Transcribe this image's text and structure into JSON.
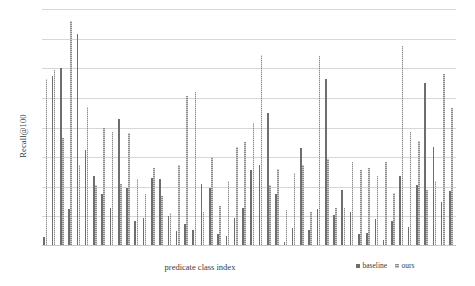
{
  "chart_data": {
    "type": "bar",
    "title": "",
    "subtitle": "",
    "xlabel": "predicate class index",
    "ylabel": "Recall@100",
    "grid": true,
    "gridlines": 8,
    "legend_position": "bottom-right",
    "ylim": [
      0,
      80
    ],
    "yticks_visible": false,
    "categories": [
      "1",
      "2",
      "3",
      "4",
      "5",
      "6",
      "7",
      "8",
      "9",
      "10",
      "11",
      "12",
      "13",
      "14",
      "15",
      "16",
      "17",
      "18",
      "19",
      "20",
      "21",
      "22",
      "23",
      "24",
      "25",
      "26",
      "27",
      "28",
      "29",
      "30",
      "31",
      "32",
      "33",
      "34",
      "35",
      "36",
      "37",
      "38",
      "39",
      "40",
      "41",
      "42",
      "43",
      "44",
      "45",
      "46",
      "47",
      "48",
      "49",
      "50"
    ],
    "series": [
      {
        "name": "baseline",
        "color": "#6e6e6e",
        "values": [
          3.0,
          57.5,
          60.0,
          12.5,
          71.5,
          32.5,
          23.5,
          17.5,
          13.0,
          43.0,
          19.5,
          8.5,
          9.5,
          23.0,
          22.5,
          10.0,
          5.0,
          7.5,
          5.5,
          21.0,
          19.5,
          4.0,
          3.5,
          9.5,
          13.0,
          25.5,
          27.5,
          45.0,
          17.5,
          1.5,
          6.0,
          33.0,
          5.5,
          12.5,
          56.5,
          10.5,
          19.0,
          11.5,
          4.0,
          4.5,
          9.0,
          2.0,
          8.5,
          23.5,
          6.5,
          20.5,
          55.0,
          33.5,
          15.0,
          18.5
        ]
      },
      {
        "name": "ours",
        "color": "#8e8e8e",
        "values": [
          56.5,
          59.5,
          36.5,
          76.0,
          27.5,
          47.0,
          20.5,
          40.0,
          38.5,
          21.0,
          38.0,
          22.5,
          17.5,
          26.5,
          17.0,
          11.0,
          27.5,
          50.5,
          52.0,
          11.5,
          30.0,
          13.5,
          22.0,
          33.5,
          35.0,
          41.5,
          64.5,
          20.5,
          26.0,
          12.0,
          24.5,
          27.5,
          11.5,
          64.0,
          29.5,
          13.0,
          13.0,
          28.5,
          25.5,
          26.5,
          23.5,
          28.5,
          18.0,
          67.5,
          38.5,
          35.5,
          19.0,
          22.0,
          58.0,
          46.5
        ]
      }
    ]
  },
  "legend": {
    "entries": [
      {
        "label": "baseline"
      },
      {
        "label": "ours"
      }
    ]
  }
}
